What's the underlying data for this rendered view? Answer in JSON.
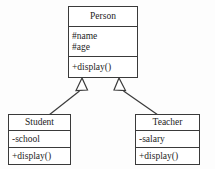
{
  "diagram": {
    "type": "uml-class-diagram",
    "background_color": "#fdfdfd",
    "line_color": "#3a3a3a",
    "text_color": "#1d1d1d"
  },
  "classes": {
    "person": {
      "name": "Person",
      "attributes": [
        "#name",
        "#age"
      ],
      "operations": [
        "+display()"
      ]
    },
    "student": {
      "name": "Student",
      "attributes": [
        "-school"
      ],
      "operations": [
        "+display()"
      ]
    },
    "teacher": {
      "name": "Teacher",
      "attributes": [
        "-salary"
      ],
      "operations": [
        "+display()"
      ]
    }
  },
  "relationships": [
    {
      "name": "student-inherits-person",
      "kind": "generalization",
      "from": "Student",
      "to": "Person",
      "arrowhead": "hollow-triangle"
    },
    {
      "name": "teacher-inherits-person",
      "kind": "generalization",
      "from": "Teacher",
      "to": "Person",
      "arrowhead": "hollow-triangle"
    }
  ]
}
